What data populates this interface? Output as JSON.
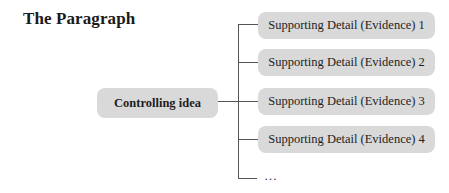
{
  "title": "The Paragraph",
  "controlling_idea": "Controlling idea",
  "details": [
    "Supporting Detail (Evidence) 1",
    "Supporting Detail (Evidence) 2",
    "Supporting Detail (Evidence) 3",
    "Supporting Detail (Evidence) 4"
  ],
  "continuation": "…",
  "colors": {
    "box_fill": "#d9d9d9",
    "line": "#555555",
    "text": "#1e1e1e"
  }
}
